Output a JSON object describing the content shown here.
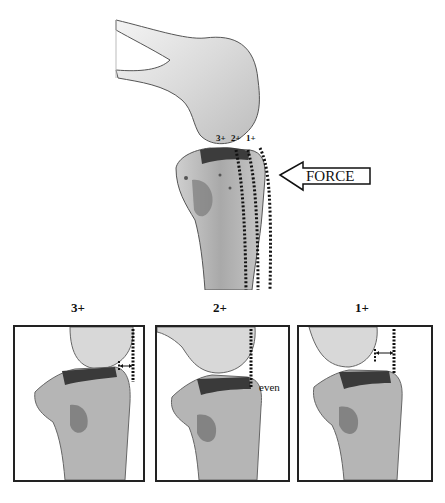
{
  "figure": {
    "main": {
      "grade_labels": [
        "3+",
        "2+",
        "1+"
      ],
      "force_label": "FORCE",
      "force_arrow_direction": "left"
    },
    "panels": [
      {
        "title": "3+",
        "annotation": ""
      },
      {
        "title": "2+",
        "annotation": "even"
      },
      {
        "title": "1+",
        "annotation": ""
      }
    ],
    "colors": {
      "bone_light": "#e2e2e2",
      "bone_mid": "#b8b8b8",
      "bone_dark": "#4a4a4a",
      "line": "#111111",
      "frame": "#222222"
    }
  }
}
